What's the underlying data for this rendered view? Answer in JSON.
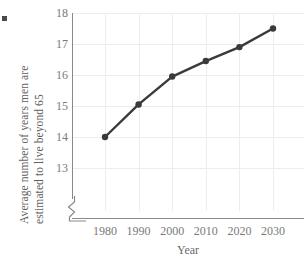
{
  "chart_data": {
    "type": "line",
    "title": "",
    "xlabel": "Year",
    "ylabel": "Average number of years men are estimated to live beyond 65",
    "ylabel_lines": [
      "Average number of years men are",
      "estimated to live beyond 65"
    ],
    "categories": [
      1980,
      1990,
      2000,
      2010,
      2020,
      2030
    ],
    "x": [
      1980,
      1990,
      2000,
      2010,
      2020,
      2030
    ],
    "values": [
      14.0,
      15.05,
      15.95,
      16.45,
      16.9,
      17.5
    ],
    "series": [
      {
        "name": "Average years men are estimated to live beyond 65",
        "values": [
          14.0,
          15.05,
          15.95,
          16.45,
          16.9,
          17.5
        ]
      }
    ],
    "xtick_labels": [
      "1980",
      "1990",
      "2000",
      "2010",
      "2020",
      "2030"
    ],
    "ytick_labels": [
      "13",
      "14",
      "15",
      "16",
      "17",
      "18"
    ],
    "yticks": [
      13,
      14,
      15,
      16,
      17,
      18
    ],
    "ylim": [
      13,
      18
    ],
    "xlim": [
      1975,
      2035
    ],
    "y_axis_break": true,
    "grid": true,
    "legend": null,
    "line_color": "#3a3a3a",
    "marker_color": "#3a3a3a",
    "grid_color": "#ececf2",
    "axis_color": "#8a8a8a",
    "text_color": "#7a7a7a"
  },
  "marks": {
    "bullet": ""
  }
}
